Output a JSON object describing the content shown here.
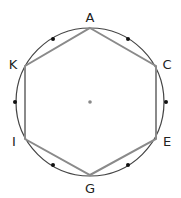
{
  "diagram": {
    "type": "circle-inscribed-hexagon",
    "circle": {
      "cx": 90,
      "cy": 102,
      "r": 74,
      "stroke": "#444444"
    },
    "center_point": {
      "x": 90,
      "y": 102,
      "color": "#888888"
    },
    "hexagon": {
      "stroke": "#8a8a8a",
      "vertices": [
        {
          "label": "A",
          "x": 90,
          "y": 28,
          "label_x": 90,
          "label_y": 22
        },
        {
          "label": "C",
          "x": 156,
          "y": 66,
          "label_x": 167,
          "label_y": 69
        },
        {
          "label": "E",
          "x": 156,
          "y": 139,
          "label_x": 167,
          "label_y": 146
        },
        {
          "label": "G",
          "x": 90,
          "y": 175,
          "label_x": 90,
          "label_y": 193
        },
        {
          "label": "I",
          "x": 25,
          "y": 139,
          "label_x": 14,
          "label_y": 146
        },
        {
          "label": "K",
          "x": 25,
          "y": 66,
          "label_x": 13,
          "label_y": 69
        }
      ]
    },
    "midpoint_dots": {
      "color": "#111111",
      "points": [
        {
          "x": 53,
          "y": 39
        },
        {
          "x": 128,
          "y": 39
        },
        {
          "x": 166,
          "y": 102
        },
        {
          "x": 128,
          "y": 165
        },
        {
          "x": 53,
          "y": 165
        },
        {
          "x": 15,
          "y": 102
        }
      ]
    }
  }
}
